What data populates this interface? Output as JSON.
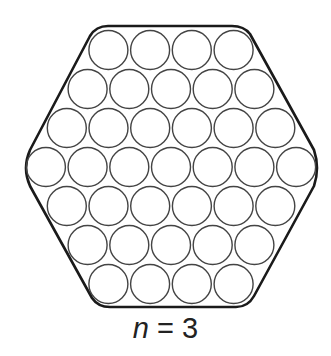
{
  "figure": {
    "n": 3,
    "row_counts": [
      4,
      5,
      6,
      7,
      6,
      5,
      4
    ],
    "total_circles": 37,
    "circle_diameter": 40,
    "stroke_color": "#444444",
    "hexagon_stroke_color": "#1a1a1a"
  },
  "label": {
    "variable": "n",
    "equals": " = ",
    "value": "3"
  }
}
